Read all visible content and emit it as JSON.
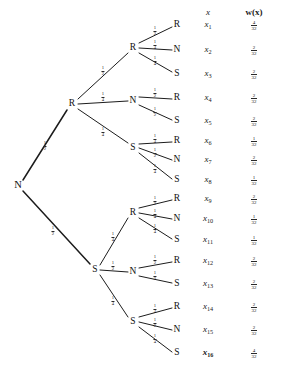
{
  "diagram": {
    "type": "probability-tree",
    "title": "",
    "columns": {
      "outcome_header": "x",
      "weight_header": "w(x)"
    },
    "root": {
      "label": "N",
      "x": 18,
      "y": 185
    },
    "weight_denominator": "32",
    "nodes": [
      {
        "id": "n0",
        "label": "N",
        "x": 18,
        "y": 185,
        "level": 0
      },
      {
        "id": "R",
        "label": "R",
        "x": 72,
        "y": 104,
        "level": 1
      },
      {
        "id": "S",
        "label": "S",
        "x": 95,
        "y": 270,
        "level": 1
      },
      {
        "id": "R-R",
        "label": "R",
        "x": 133,
        "y": 48,
        "level": 2
      },
      {
        "id": "R-N",
        "label": "N",
        "x": 133,
        "y": 101,
        "level": 2
      },
      {
        "id": "R-S",
        "label": "S",
        "x": 133,
        "y": 148,
        "level": 2
      },
      {
        "id": "S-R",
        "label": "R",
        "x": 133,
        "y": 213,
        "level": 2
      },
      {
        "id": "S-N",
        "label": "N",
        "x": 133,
        "y": 272,
        "level": 2
      },
      {
        "id": "S-S",
        "label": "S",
        "x": 133,
        "y": 322,
        "level": 2
      }
    ],
    "leaves": [
      {
        "label": "R",
        "x": 177,
        "y": 25,
        "outcome": "x",
        "index": "1",
        "w_num": "4",
        "w_den": "32"
      },
      {
        "label": "N",
        "x": 177,
        "y": 50,
        "outcome": "x",
        "index": "2",
        "w_num": "2",
        "w_den": "32"
      },
      {
        "label": "S",
        "x": 177,
        "y": 74,
        "outcome": "x",
        "index": "3",
        "w_num": "2",
        "w_den": "32"
      },
      {
        "label": "R",
        "x": 177,
        "y": 98,
        "outcome": "x",
        "index": "4",
        "w_num": "2",
        "w_den": "32"
      },
      {
        "label": "S",
        "x": 177,
        "y": 121,
        "outcome": "x",
        "index": "5",
        "w_num": "2",
        "w_den": "32"
      },
      {
        "label": "R",
        "x": 177,
        "y": 141,
        "outcome": "x",
        "index": "6",
        "w_num": "1",
        "w_den": "32"
      },
      {
        "label": "N",
        "x": 177,
        "y": 160,
        "outcome": "x",
        "index": "7",
        "w_num": "2",
        "w_den": "32"
      },
      {
        "label": "S",
        "x": 177,
        "y": 180,
        "outcome": "x",
        "index": "8",
        "w_num": "1",
        "w_den": "32"
      },
      {
        "label": "R",
        "x": 177,
        "y": 199,
        "outcome": "x",
        "index": "9",
        "w_num": "2",
        "w_den": "32"
      },
      {
        "label": "N",
        "x": 177,
        "y": 219,
        "outcome": "x",
        "index": "10",
        "w_num": "1",
        "w_den": "32"
      },
      {
        "label": "S",
        "x": 177,
        "y": 240,
        "outcome": "x",
        "index": "11",
        "w_num": "1",
        "w_den": "32"
      },
      {
        "label": "R",
        "x": 177,
        "y": 261,
        "outcome": "x",
        "index": "12",
        "w_num": "2",
        "w_den": "32"
      },
      {
        "label": "S",
        "x": 177,
        "y": 284,
        "outcome": "x",
        "index": "13",
        "w_num": "2",
        "w_den": "32"
      },
      {
        "label": "R",
        "x": 177,
        "y": 307,
        "outcome": "x",
        "index": "14",
        "w_num": "2",
        "w_den": "32"
      },
      {
        "label": "N",
        "x": 177,
        "y": 330,
        "outcome": "x",
        "index": "15",
        "w_num": "2",
        "w_den": "32"
      },
      {
        "label": "S",
        "x": 177,
        "y": 353,
        "outcome": "x",
        "index": "16",
        "w_num": "4",
        "w_den": "32"
      }
    ],
    "edges": [
      {
        "from": "n0",
        "to": "R",
        "x1": 23,
        "y1": 180,
        "x2": 67,
        "y2": 110,
        "lx": 45,
        "ly": 145,
        "num": "1",
        "den": "2"
      },
      {
        "from": "n0",
        "to": "S",
        "x1": 23,
        "y1": 191,
        "x2": 90,
        "y2": 264,
        "lx": 53,
        "ly": 230,
        "num": "1",
        "den": "2"
      },
      {
        "from": "R",
        "to": "R-R",
        "x1": 78,
        "y1": 99,
        "x2": 128,
        "y2": 53,
        "lx": 103,
        "ly": 70,
        "num": "1",
        "den": "2"
      },
      {
        "from": "R",
        "to": "R-N",
        "x1": 78,
        "y1": 104,
        "x2": 128,
        "y2": 101,
        "lx": 103,
        "ly": 96,
        "num": "1",
        "den": "4"
      },
      {
        "from": "R",
        "to": "R-S",
        "x1": 78,
        "y1": 109,
        "x2": 128,
        "y2": 143,
        "lx": 103,
        "ly": 131,
        "num": "1",
        "den": "4"
      },
      {
        "from": "S",
        "to": "S-R",
        "x1": 100,
        "y1": 265,
        "x2": 128,
        "y2": 218,
        "lx": 113,
        "ly": 236,
        "num": "1",
        "den": "4"
      },
      {
        "from": "S",
        "to": "S-N",
        "x1": 100,
        "y1": 270,
        "x2": 128,
        "y2": 272,
        "lx": 113,
        "ly": 265,
        "num": "1",
        "den": "2"
      },
      {
        "from": "S",
        "to": "S-S",
        "x1": 100,
        "y1": 275,
        "x2": 128,
        "y2": 317,
        "lx": 113,
        "ly": 300,
        "num": "1",
        "den": "4"
      },
      {
        "from": "R-R",
        "to": "L1",
        "x1": 139,
        "y1": 43,
        "x2": 172,
        "y2": 27,
        "lx": 155,
        "ly": 30,
        "num": "1",
        "den": "2"
      },
      {
        "from": "R-R",
        "to": "L2",
        "x1": 139,
        "y1": 48,
        "x2": 172,
        "y2": 50,
        "lx": 155,
        "ly": 44,
        "num": "1",
        "den": "4"
      },
      {
        "from": "R-R",
        "to": "L3",
        "x1": 139,
        "y1": 53,
        "x2": 172,
        "y2": 72,
        "lx": 155,
        "ly": 60,
        "num": "1",
        "den": "4"
      },
      {
        "from": "R-N",
        "to": "L4",
        "x1": 139,
        "y1": 97,
        "x2": 172,
        "y2": 99,
        "lx": 155,
        "ly": 92,
        "num": "1",
        "den": "2"
      },
      {
        "from": "R-N",
        "to": "L5",
        "x1": 139,
        "y1": 105,
        "x2": 172,
        "y2": 120,
        "lx": 155,
        "ly": 111,
        "num": "1",
        "den": "2"
      },
      {
        "from": "R-S",
        "to": "L6",
        "x1": 139,
        "y1": 144,
        "x2": 172,
        "y2": 142,
        "lx": 155,
        "ly": 138,
        "num": "1",
        "den": "4"
      },
      {
        "from": "R-S",
        "to": "L7",
        "x1": 139,
        "y1": 148,
        "x2": 172,
        "y2": 160,
        "lx": 155,
        "ly": 152,
        "num": "1",
        "den": "2"
      },
      {
        "from": "R-S",
        "to": "L8",
        "x1": 139,
        "y1": 153,
        "x2": 172,
        "y2": 179,
        "lx": 155,
        "ly": 168,
        "num": "1",
        "den": "4"
      },
      {
        "from": "S-R",
        "to": "L9",
        "x1": 139,
        "y1": 208,
        "x2": 172,
        "y2": 200,
        "lx": 155,
        "ly": 200,
        "num": "1",
        "den": "2"
      },
      {
        "from": "S-R",
        "to": "L10",
        "x1": 139,
        "y1": 213,
        "x2": 172,
        "y2": 219,
        "lx": 155,
        "ly": 213,
        "num": "1",
        "den": "4"
      },
      {
        "from": "S-R",
        "to": "L11",
        "x1": 139,
        "y1": 218,
        "x2": 172,
        "y2": 239,
        "lx": 155,
        "ly": 228,
        "num": "1",
        "den": "4"
      },
      {
        "from": "S-N",
        "to": "L12",
        "x1": 139,
        "y1": 268,
        "x2": 172,
        "y2": 262,
        "lx": 155,
        "ly": 259,
        "num": "1",
        "den": "2"
      },
      {
        "from": "S-N",
        "to": "L13",
        "x1": 139,
        "y1": 276,
        "x2": 172,
        "y2": 283,
        "lx": 155,
        "ly": 275,
        "num": "1",
        "den": "2"
      },
      {
        "from": "S-S",
        "to": "L14",
        "x1": 139,
        "y1": 317,
        "x2": 172,
        "y2": 308,
        "lx": 155,
        "ly": 308,
        "num": "1",
        "den": "4"
      },
      {
        "from": "S-S",
        "to": "L15",
        "x1": 139,
        "y1": 322,
        "x2": 172,
        "y2": 330,
        "lx": 155,
        "ly": 322,
        "num": "1",
        "den": "2"
      },
      {
        "from": "S-S",
        "to": "L16",
        "x1": 139,
        "y1": 327,
        "x2": 172,
        "y2": 352,
        "lx": 155,
        "ly": 338,
        "num": "1",
        "den": "4"
      }
    ],
    "header_positions": {
      "outcome_x": 208,
      "weight_x": 254,
      "y": 12
    },
    "outcome_column_x": 208,
    "weight_column_x": 254
  }
}
